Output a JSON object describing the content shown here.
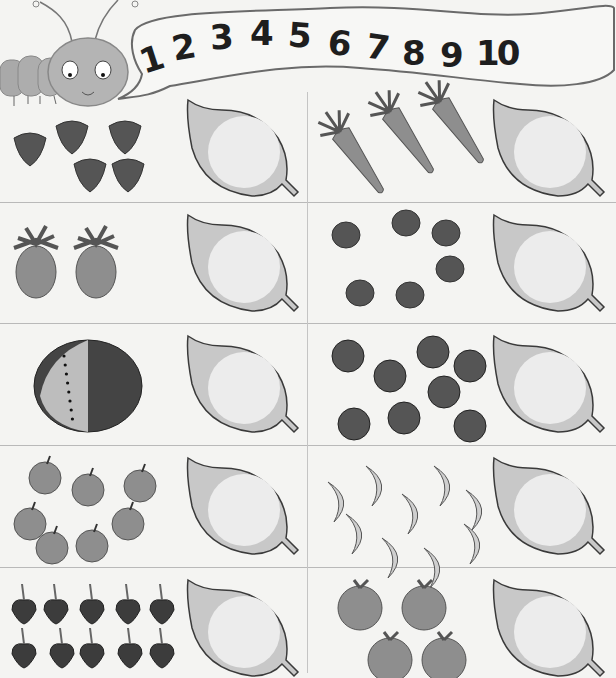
{
  "worksheet": {
    "title_numbers": [
      "1",
      "2",
      "3",
      "4",
      "5",
      "6",
      "7",
      "8",
      "9",
      "10"
    ],
    "mascot": "caterpillar",
    "task": "count-and-write",
    "rows": [
      {
        "left": {
          "fruit": "strawberry",
          "count": 5
        },
        "right": {
          "fruit": "carrot",
          "count": 3
        }
      },
      {
        "left": {
          "fruit": "pineapple",
          "count": 2
        },
        "right": {
          "fruit": "blueberry",
          "count": 6
        }
      },
      {
        "left": {
          "fruit": "watermelon",
          "count": 1
        },
        "right": {
          "fruit": "plum",
          "count": 8
        }
      },
      {
        "left": {
          "fruit": "apple",
          "count": 7
        },
        "right": {
          "fruit": "banana",
          "count": 9
        }
      },
      {
        "left": {
          "fruit": "cherry",
          "count": 10
        },
        "right": {
          "fruit": "orange",
          "count": 4
        }
      }
    ],
    "answer_leaf": {
      "value": ""
    }
  },
  "colors": {
    "background": "#f4f4f2",
    "ink": "#1e1e1e",
    "leaf_outer": "#c8c8c8",
    "leaf_inner": "#ececec",
    "dark_fruit": "#555555",
    "mid_fruit": "#8e8e8e",
    "light_fruit": "#cfcfcf"
  }
}
